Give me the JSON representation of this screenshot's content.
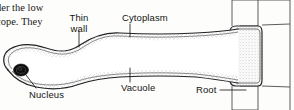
{
  "figure": {
    "kind": "biology-diagram",
    "body_text": {
      "line_1": "der the low",
      "line_2": "cope. They"
    },
    "labels": {
      "thin_wall_line_1": "Thin",
      "thin_wall_line_2": "wall",
      "cytoplasm": "Cytoplasm",
      "vacuole": "Vacuole",
      "nucleus": "Nucleus",
      "root": "Root"
    },
    "colors": {
      "ink": "#1c1c1c",
      "paper": "#fdfdfb",
      "wall_stroke": "#262626",
      "cytoplasm_stipple": "#8a8a8a",
      "nucleus_fill": "#101010",
      "cell_grid_stroke": "#4a4a4a"
    }
  }
}
